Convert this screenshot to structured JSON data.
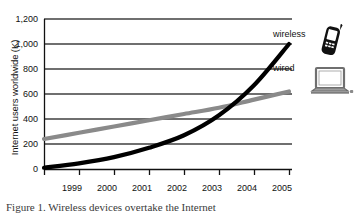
{
  "figure": {
    "caption": "Figure 1.   Wireless devices overtake the Internet"
  },
  "axis": {
    "y_label": "Internet users worldwide (K)",
    "y_ticks": [
      "0",
      "200",
      "400",
      "600",
      "800",
      "1,000",
      "1,200"
    ],
    "x_ticks": [
      "1999",
      "2000",
      "2001",
      "2002",
      "2003",
      "2004",
      "2005"
    ]
  },
  "legend": {
    "wireless_label": "wireless",
    "wired_label": "wired",
    "wireless_icon": "mobile-phone-icon",
    "wired_icon": "laptop-icon"
  },
  "colors": {
    "wireless": "#000000",
    "wired": "#8a8a8a",
    "grid": "#4a4a4a",
    "axis": "#111111",
    "background": "#ffffff"
  },
  "chart_data": {
    "type": "line",
    "title": "",
    "xlabel": "",
    "ylabel": "Internet users worldwide (K)",
    "xlim": [
      1998,
      2005
    ],
    "ylim": [
      0,
      1200
    ],
    "grid": true,
    "legend_position": "right-inline",
    "x": [
      1998,
      1999,
      2000,
      2001,
      2002,
      2003,
      2004,
      2005
    ],
    "series": [
      {
        "name": "wireless",
        "color": "#000000",
        "values": [
          10,
          45,
          95,
          170,
          270,
          430,
          670,
          1000
        ]
      },
      {
        "name": "wired",
        "color": "#8a8a8a",
        "values": [
          240,
          290,
          340,
          390,
          440,
          490,
          555,
          620
        ]
      }
    ]
  }
}
